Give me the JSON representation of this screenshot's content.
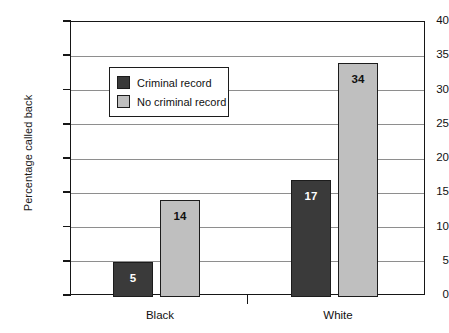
{
  "chart_data": {
    "type": "bar",
    "title": "",
    "subtitle": "",
    "xlabel": "",
    "ylabel": "Percentage called back",
    "categories": [
      "Black",
      "White"
    ],
    "series": [
      {
        "name": "Criminal record",
        "values": [
          5,
          17
        ],
        "color": "#3a3a3a"
      },
      {
        "name": "No criminal record",
        "values": [
          14,
          34
        ],
        "color": "#bfbfbf"
      }
    ],
    "ylim": [
      0,
      40
    ],
    "ytick_step": 5,
    "yticks": [
      0,
      5,
      10,
      15,
      20,
      25,
      30,
      35,
      40
    ],
    "ytick_labels": [
      "0",
      "5",
      "10",
      "15",
      "20",
      "25",
      "30",
      "35",
      "40"
    ],
    "grid": "horizontal",
    "legend_position": "upper-left-inside",
    "bar_value_labels": [
      "5",
      "14",
      "17",
      "34"
    ],
    "annotations": []
  },
  "legend": {
    "items": [
      {
        "label": "Criminal record",
        "color": "#3a3a3a"
      },
      {
        "label": "No criminal record",
        "color": "#bfbfbf"
      }
    ]
  },
  "axes": {
    "y_title": "Percentage called back",
    "y_labels": [
      "40",
      "35",
      "30",
      "25",
      "20",
      "15",
      "10",
      "5",
      "0"
    ],
    "x_labels": [
      "Black",
      "White"
    ]
  },
  "bars": [
    {
      "group": "Black",
      "series": "Criminal record",
      "value": 5,
      "label": "5",
      "fill": "#3a3a3a",
      "text_color": "#ffffff"
    },
    {
      "group": "Black",
      "series": "No criminal record",
      "value": 14,
      "label": "14",
      "fill": "#bfbfbf",
      "text_color": "#111111"
    },
    {
      "group": "White",
      "series": "Criminal record",
      "value": 17,
      "label": "17",
      "fill": "#3a3a3a",
      "text_color": "#ffffff"
    },
    {
      "group": "White",
      "series": "No criminal record",
      "value": 34,
      "label": "34",
      "fill": "#bfbfbf",
      "text_color": "#111111"
    }
  ],
  "colors": {
    "dark_bar": "#3a3a3a",
    "light_bar": "#bfbfbf",
    "axis": "#161616",
    "gridline": "#8e8e8e",
    "background": "#ffffff"
  }
}
